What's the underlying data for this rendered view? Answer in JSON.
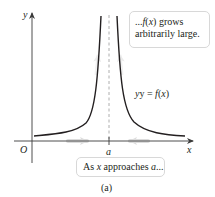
{
  "diagram": {
    "axes": {
      "x_label": "x",
      "y_label": "y",
      "origin_label": "O",
      "asymptote_label": "a"
    },
    "curve": {
      "label_prefix": "y = ",
      "label_func": "f",
      "label_arg": "(x)"
    },
    "callout_top": {
      "line1_prefix": "...",
      "line1_func": "f",
      "line1_arg": "(x)",
      "line1_suffix": " grows",
      "line2": "arbitrarily large."
    },
    "callout_bottom": {
      "prefix": "As ",
      "var": "x",
      "middle": " approaches ",
      "target": "a",
      "suffix": "..."
    },
    "caption": "(a)",
    "colors": {
      "curve": "#231f20",
      "axis": "#3a3a3a",
      "asymptote": "#9a9a9a",
      "hint_arrows": "#d9d9d9",
      "callout_border": "#d8d8d8"
    }
  }
}
